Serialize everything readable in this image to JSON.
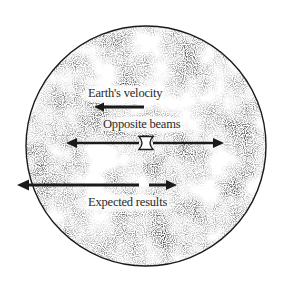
{
  "diagram": {
    "subject": "Earth",
    "labels": {
      "earth_velocity": "Earth's velocity",
      "opposite_beams": "Opposite beams",
      "expected_results": "Expected results"
    },
    "colors": {
      "ink": "#1a1a1a",
      "stipple": "#3a3a3a",
      "background": "#ffffff"
    }
  }
}
